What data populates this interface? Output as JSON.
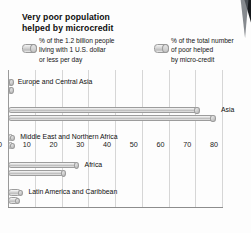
{
  "title": {
    "line1": "Very poor population",
    "line2": "helped by microcredit"
  },
  "legend": {
    "series_a": {
      "name": "poor-population-share",
      "line1": "% of the 1.2 billion people",
      "line2": "living with 1 U.S. dollar",
      "line3": "or less per day"
    },
    "series_b": {
      "name": "poor-helped-share",
      "line1": "% of the total number",
      "line2": "of poor helped",
      "line3": "by micro-credit"
    }
  },
  "chart_data": {
    "type": "bar",
    "orientation": "horizontal",
    "title": "Very poor population helped by microcredit",
    "xlabel": "",
    "ylabel": "",
    "xlim": [
      0,
      80
    ],
    "xticks": [
      0,
      10,
      20,
      30,
      40,
      50,
      60,
      70,
      80
    ],
    "grid": true,
    "legend_position": "top",
    "categories": [
      "Europe and Central Asia",
      "Asia",
      "Middle East and Northern Africa",
      "Africa",
      "Latin America and Caribbean"
    ],
    "series": [
      {
        "name": "% of the 1.2 billion people living with 1 U.S. dollar or less per day",
        "values": [
          1,
          71,
          2,
          26,
          5
        ]
      },
      {
        "name": "% of the total number of poor helped by micro-credit",
        "values": [
          1,
          77,
          2,
          21,
          4
        ]
      }
    ]
  },
  "colors": {
    "bar_fill": "#d2d2d2",
    "bar_edge": "#9c9c9c",
    "grid": "#d6d6d6",
    "axis": "#8d8d8d",
    "text": "#111111",
    "page": "#fdfdfd"
  }
}
